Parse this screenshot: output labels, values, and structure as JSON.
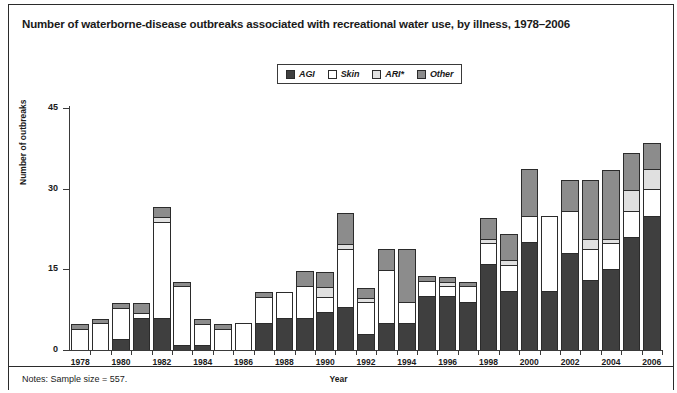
{
  "figure": {
    "title": "Number of waterborne-disease outbreaks associated with recreational water use, by illness, 1978–2006",
    "notes": "Notes: Sample size = 557."
  },
  "legend": {
    "position": "top-center",
    "items": [
      {
        "label": "AGI",
        "color": "#3f3f3f"
      },
      {
        "label": "Skin",
        "color": "#ffffff"
      },
      {
        "label": "ARI*",
        "color": "#e0e0e0"
      },
      {
        "label": "Other",
        "color": "#8c8c8c"
      }
    ]
  },
  "axes": {
    "y_title": "Number of outbreaks",
    "x_title": "Year",
    "y_ticks": [
      "0",
      "15",
      "30",
      "45"
    ],
    "x_tick_labels": [
      "1978",
      "1980",
      "1982",
      "1984",
      "1986",
      "1988",
      "1990",
      "1992",
      "1994",
      "1996",
      "1998",
      "2000",
      "2002",
      "2004",
      "2006"
    ]
  },
  "chart_data": {
    "type": "bar",
    "stacked": true,
    "title": "Number of waterborne-disease outbreaks associated with recreational water use, by illness, 1978–2006",
    "xlabel": "Year",
    "ylabel": "Number of outbreaks",
    "ylim": [
      0,
      45
    ],
    "yticks": [
      0,
      15,
      30,
      45
    ],
    "grid": false,
    "legend_position": "top-center",
    "categories": [
      "1978",
      "1979",
      "1980",
      "1981",
      "1982",
      "1983",
      "1984",
      "1985",
      "1986",
      "1987",
      "1988",
      "1989",
      "1990",
      "1991",
      "1992",
      "1993",
      "1994",
      "1995",
      "1996",
      "1997",
      "1998",
      "1999",
      "2000",
      "2001",
      "2002",
      "2003",
      "2004",
      "2005",
      "2006"
    ],
    "series": [
      {
        "name": "AGI",
        "color": "#3f3f3f",
        "values": [
          0,
          0,
          2,
          6,
          6,
          1,
          1,
          0,
          0,
          5,
          6,
          6,
          7,
          8,
          3,
          5,
          5,
          10,
          10,
          9,
          16,
          11,
          20,
          11,
          18,
          13,
          15,
          21,
          25
        ]
      },
      {
        "name": "Skin",
        "color": "#ffffff",
        "values": [
          4,
          5,
          6,
          1,
          18,
          11,
          4,
          4,
          5,
          5,
          5,
          6,
          3,
          11,
          6,
          10,
          4,
          3,
          2,
          3,
          4,
          5,
          5,
          14,
          8,
          6,
          5,
          5,
          5
        ]
      },
      {
        "name": "ARI*",
        "color": "#e0e0e0",
        "values": [
          0,
          0,
          0,
          0,
          1,
          0,
          0,
          0,
          0,
          0,
          0,
          0,
          2,
          1,
          1,
          0,
          0,
          0,
          1,
          0,
          1,
          1,
          0,
          0,
          0,
          2,
          1,
          4,
          4
        ]
      },
      {
        "name": "Other",
        "color": "#8c8c8c",
        "values": [
          1,
          1,
          1,
          2,
          2,
          1,
          1,
          1,
          0,
          1,
          0,
          3,
          3,
          6,
          2,
          4,
          10,
          1,
          1,
          1,
          4,
          5,
          9,
          0,
          6,
          11,
          13,
          7,
          5
        ]
      }
    ]
  }
}
